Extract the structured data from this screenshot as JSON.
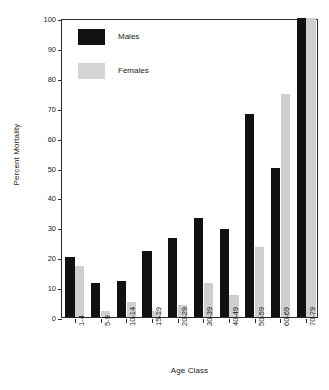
{
  "chart_data": {
    "type": "bar",
    "title": "",
    "xlabel": "Age Class",
    "ylabel": "Percent Mortality",
    "categories": [
      "1-4",
      "5-9",
      "10-14",
      "15-19",
      "20-29",
      "30-39",
      "40-49",
      "50-59",
      "60-69",
      "70-79"
    ],
    "series": [
      {
        "name": "Males",
        "color": "#111111",
        "values": [
          20,
          11.5,
          12,
          22,
          26.5,
          33,
          29.5,
          68,
          50,
          100
        ]
      },
      {
        "name": "Females",
        "color": "#cfcfcf",
        "values": [
          17,
          2,
          5,
          2,
          4,
          11.5,
          7.5,
          23.5,
          74.5,
          100
        ]
      }
    ],
    "ylim": [
      0,
      100
    ],
    "yticks": [
      0,
      10,
      20,
      30,
      40,
      50,
      60,
      70,
      80,
      90,
      100
    ],
    "ytick_labels": [
      "0",
      "10",
      "20",
      "30",
      "40",
      "50",
      "60",
      "70",
      "80",
      "90",
      "100"
    ],
    "grid": false,
    "legend_position": "top-left",
    "legend": [
      "Males",
      "Females"
    ],
    "xtick_rotation": 90,
    "bar_layout": "grouped"
  },
  "legend": {
    "items": [
      {
        "label": "Males",
        "swatch": "male-swatch"
      },
      {
        "label": "Females",
        "swatch": "female-swatch"
      }
    ]
  },
  "axes": {
    "y_title": "Percent Mortality",
    "x_title": "Age Class"
  }
}
